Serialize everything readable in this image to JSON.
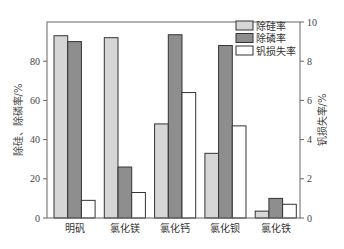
{
  "chart_data": {
    "type": "bar",
    "title": "",
    "categories": [
      "明矾",
      "氯化镁",
      "氯化钙",
      "氯化钡",
      "氯化铁"
    ],
    "series": [
      {
        "name": "除硅率",
        "axis": "left",
        "color": "#d6d6d6",
        "values": [
          93,
          92,
          48,
          33,
          3.5
        ]
      },
      {
        "name": "除磷率",
        "axis": "left",
        "color": "#8e8e8e",
        "values": [
          90,
          26,
          93.5,
          88,
          10
        ]
      },
      {
        "name": "钒损失率",
        "axis": "right",
        "color": "#ffffff",
        "values": [
          0.9,
          1.3,
          6.4,
          4.7,
          0.7
        ]
      }
    ],
    "xlabel": "",
    "ylabel": "除硅、除磷率/%",
    "ylabel_right": "钒损失率/%",
    "ylim": [
      0,
      100
    ],
    "ylim_right": [
      0,
      10
    ],
    "yticks": [
      0,
      20,
      40,
      60,
      80
    ],
    "yticks_right": [
      0,
      2,
      4,
      6,
      8,
      10
    ],
    "grid": false,
    "legend_position": "upper right"
  }
}
